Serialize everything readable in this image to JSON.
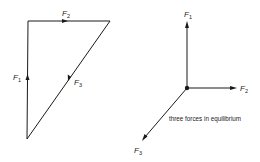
{
  "diagram": {
    "left": {
      "title": "force triangle",
      "labels": {
        "f1": {
          "base": "F",
          "sub": "1"
        },
        "f2": {
          "base": "F",
          "sub": "2"
        },
        "f3": {
          "base": "F",
          "sub": "3"
        }
      }
    },
    "right": {
      "title": "concurrent forces",
      "labels": {
        "f1": {
          "base": "F",
          "sub": "1"
        },
        "f2": {
          "base": "F",
          "sub": "2"
        },
        "f3": {
          "base": "F",
          "sub": "3"
        }
      },
      "caption": "three forces in equilibrium"
    },
    "colors": {
      "ink": "#1a1a1a",
      "background": "#ffffff"
    }
  }
}
